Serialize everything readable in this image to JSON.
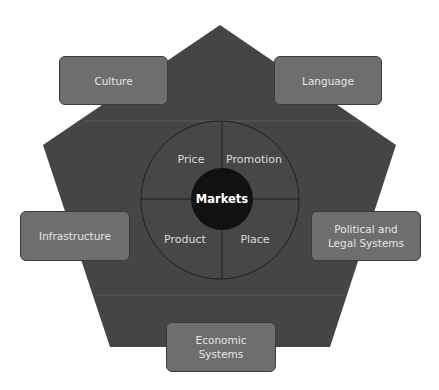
{
  "diagram": {
    "center": "Markets",
    "quadrants": {
      "top_left": "Price",
      "top_right": "Promotion",
      "bottom_left": "Product",
      "bottom_right": "Place"
    },
    "factors": {
      "culture": "Culture",
      "language": "Language",
      "infrastructure": "Infrastructure",
      "political_line1": "Political and",
      "political_line2": "Legal Systems",
      "economic_line1": "Economic",
      "economic_line2": "Systems"
    },
    "colors": {
      "pentagon": "#454545",
      "ring": "#4a4a4a",
      "core": "#111111",
      "factor_box": "#6e6e6e",
      "text": "#e6e6e6"
    }
  }
}
